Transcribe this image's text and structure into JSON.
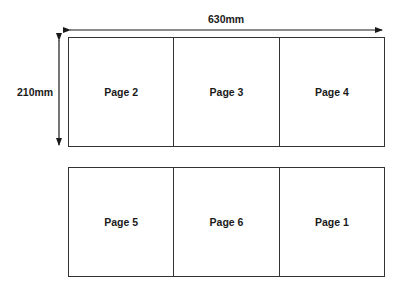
{
  "dimensions": {
    "width_label": "630mm",
    "height_label": "210mm"
  },
  "panels": [
    {
      "cells": [
        {
          "label": "Page 2"
        },
        {
          "label": "Page 3"
        },
        {
          "label": "Page 4"
        }
      ]
    },
    {
      "cells": [
        {
          "label": "Page 5"
        },
        {
          "label": "Page 6"
        },
        {
          "label": "Page 1"
        }
      ]
    }
  ],
  "colors": {
    "line": "#333333",
    "text": "#1a1a1a",
    "background": "#ffffff"
  }
}
